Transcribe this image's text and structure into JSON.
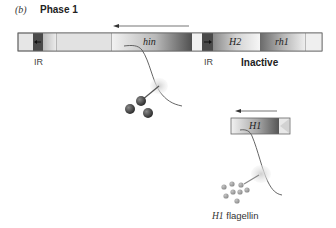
{
  "header": {
    "panel_letter": "(b)",
    "title": "Phase 1"
  },
  "chromosome": {
    "segments": [
      {
        "name": "left-flank",
        "label": ""
      },
      {
        "name": "left-ir",
        "label": ""
      },
      {
        "name": "spacer",
        "label": ""
      },
      {
        "name": "hin",
        "label": "hin"
      },
      {
        "name": "gap",
        "label": ""
      },
      {
        "name": "right-ir",
        "label": ""
      },
      {
        "name": "H2",
        "label": "H2"
      },
      {
        "name": "rh1",
        "label": "rh1"
      },
      {
        "name": "right-flank",
        "label": ""
      }
    ],
    "labels": {
      "left_ir": "IR",
      "right_ir": "IR",
      "status": "Inactive"
    }
  },
  "h1_gene": {
    "label": "H1"
  },
  "product": {
    "gene_italic": "H1",
    "text": " flagellin"
  },
  "colors": {
    "bar_light": "#e4e4e4",
    "bar_border": "#555555",
    "ir_dark": "#4a4a4a",
    "gene_dark": "#5a5a5a",
    "protein_dark": "#3f3f3f",
    "protein_light": "#9a9a9a",
    "ribosome": "#d8d8d8",
    "arrow": "#333333"
  }
}
